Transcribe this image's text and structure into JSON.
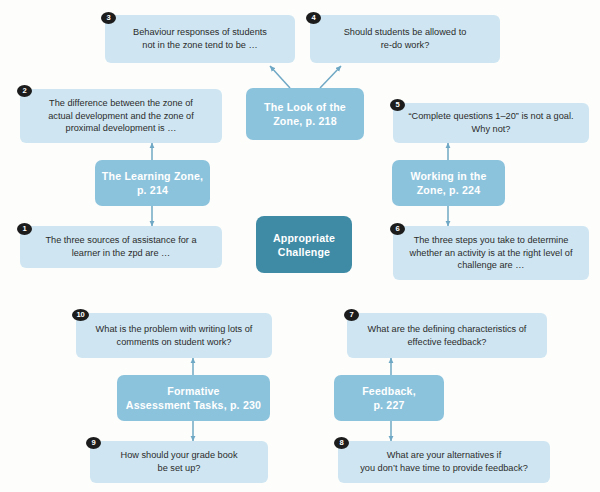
{
  "diagram": {
    "title": "Appropriate Challenge",
    "type": "concept-map",
    "colors": {
      "question_card": "#cfe6f2",
      "section_card": "#8cc3dc",
      "hub_card": "#3f8ba5",
      "badge": "#1c1c1c",
      "connector": "#6fa8c4",
      "page_background": "#fdfdfc"
    },
    "hub": {
      "label": "Appropriate\nChallenge"
    },
    "sections": [
      {
        "id": "learning-zone",
        "label": "The Learning Zone,\np. 214"
      },
      {
        "id": "look-of-zone",
        "label": "The Look of the\nZone, p. 218"
      },
      {
        "id": "working-in-zone",
        "label": "Working in the\nZone, p. 224"
      },
      {
        "id": "feedback",
        "label": "Feedback,\np. 227"
      },
      {
        "id": "formative",
        "label": "Formative\nAssessment Tasks, p. 230"
      }
    ],
    "questions": [
      {
        "number": "1",
        "text": "The three sources of assistance for a\nlearner in the zpd are …"
      },
      {
        "number": "2",
        "text": "The difference between the zone of\nactual development and the zone of\nproximal development is …"
      },
      {
        "number": "3",
        "text": "Behaviour responses of students\nnot in the zone tend to be …"
      },
      {
        "number": "4",
        "text": "Should students be allowed to\nre-do work?"
      },
      {
        "number": "5",
        "text": "“Complete questions 1–20” is not a goal.\nWhy not?"
      },
      {
        "number": "6",
        "text": "The three steps you take to determine\nwhether an activity is at the right level of\nchallenge are …"
      },
      {
        "number": "7",
        "text": "What are the defining characteristics of\neffective feedback?"
      },
      {
        "number": "8",
        "text": "What are your alternatives if\nyou don’t have time to provide feedback?"
      },
      {
        "number": "9",
        "text": "How should your grade book\nbe set up?"
      },
      {
        "number": "10",
        "text": "What is the problem with writing lots of\ncomments on student work?"
      }
    ]
  }
}
